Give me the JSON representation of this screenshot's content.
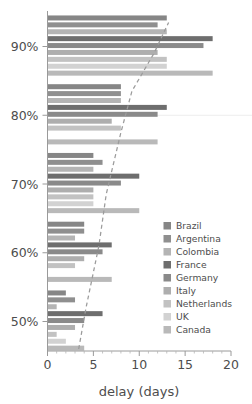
{
  "chart_data": {
    "type": "bar",
    "orientation": "horizontal",
    "title": "",
    "xlabel": "delay (days)",
    "ylabel": "",
    "xlim": [
      0,
      20
    ],
    "xticks": [
      0,
      5,
      10,
      15,
      20
    ],
    "xtick_labels": [
      "0",
      "5",
      "10",
      "15",
      "20"
    ],
    "yticks": [
      50,
      60,
      70,
      80,
      90
    ],
    "ytick_labels": [
      "50%",
      "60%",
      "70%",
      "80%",
      "90%"
    ],
    "grid": false,
    "legend_position": "right-middle",
    "categories": [
      "50%",
      "60%",
      "70%",
      "80%",
      "90%"
    ],
    "series": [
      {
        "name": "Brazil",
        "color": "#868686",
        "values": [
          2,
          4,
          5,
          8,
          13
        ]
      },
      {
        "name": "Argentina",
        "color": "#8f8f8f",
        "values": [
          3,
          4,
          6,
          8,
          12
        ]
      },
      {
        "name": "Colombia",
        "color": "#b4b4b4",
        "values": [
          1,
          3,
          5,
          8,
          13
        ]
      },
      {
        "name": "France",
        "color": "#6e6e6e",
        "values": [
          6,
          7,
          10,
          13,
          18
        ]
      },
      {
        "name": "Germany",
        "color": "#8a8a8a",
        "values": [
          4,
          6,
          8,
          12,
          17
        ]
      },
      {
        "name": "Italy",
        "color": "#aeaeae",
        "values": [
          3,
          4,
          5,
          7,
          12
        ]
      },
      {
        "name": "Netherlands",
        "color": "#c2c2c2",
        "values": [
          1,
          3,
          5,
          8,
          13
        ]
      },
      {
        "name": "UK",
        "color": "#d2d2d2",
        "values": [
          2,
          0,
          5,
          0,
          13
        ]
      },
      {
        "name": "Canada",
        "color": "#b9b9b9",
        "values": [
          4,
          7,
          10,
          12,
          18
        ]
      }
    ],
    "trend_line": {
      "style": "dashed",
      "color": "#9b9b9b",
      "points": [
        {
          "x": 3.4,
          "y": 46.0
        },
        {
          "x": 4.2,
          "y": 52.0
        },
        {
          "x": 5.6,
          "y": 61.0
        },
        {
          "x": 6.4,
          "y": 68.5
        },
        {
          "x": 8.0,
          "y": 77.5
        },
        {
          "x": 9.2,
          "y": 83.5
        },
        {
          "x": 11.6,
          "y": 89.0
        },
        {
          "x": 13.2,
          "y": 93.5
        }
      ]
    }
  },
  "legend": {
    "items": [
      {
        "label": "Brazil"
      },
      {
        "label": "Argentina"
      },
      {
        "label": "Colombia"
      },
      {
        "label": "France"
      },
      {
        "label": "Germany"
      },
      {
        "label": "Italy"
      },
      {
        "label": "Netherlands"
      },
      {
        "label": "UK"
      },
      {
        "label": "Canada"
      }
    ]
  },
  "axis": {
    "x_title": "delay (days)"
  }
}
